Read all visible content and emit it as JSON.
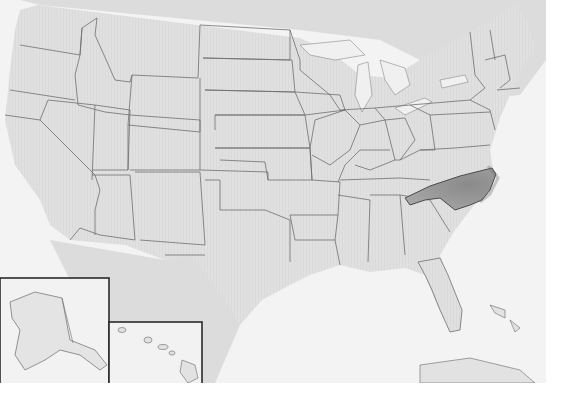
{
  "map": {
    "title": "",
    "subject": "United States",
    "highlighted_region": "North Carolina",
    "colors": {
      "land": "#e2e2e2",
      "water": "#f3f3f3",
      "border": "#6e6e6e",
      "highlight": "#9a9a9a",
      "inset_frame": "#2a2a2a"
    },
    "insets": [
      {
        "name": "Alaska"
      },
      {
        "name": "Hawaii"
      }
    ],
    "visible_labels": []
  }
}
